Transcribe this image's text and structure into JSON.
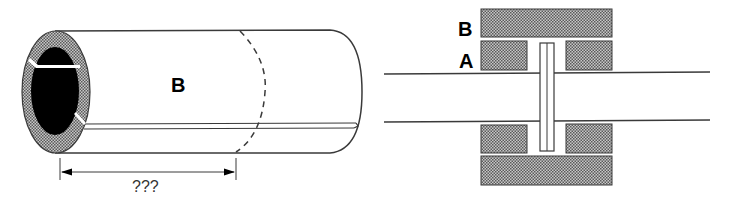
{
  "left_figure": {
    "cylinder_label": "B",
    "dimension_label": "???"
  },
  "right_figure": {
    "outer_label": "B",
    "inner_label": "A"
  },
  "colors": {
    "stroke": "#3a3a3a",
    "hatch_fill": "#9a9a9a",
    "core_fill": "#000000",
    "background": "#ffffff"
  }
}
